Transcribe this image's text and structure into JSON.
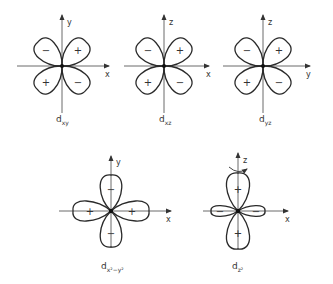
{
  "orbitals": [
    {
      "id": "dxy",
      "label_main": "d",
      "label_sub": "xy",
      "horizontal_axis": "x",
      "vertical_axis": "y",
      "lobe_orientation": "diagonal",
      "lobe_signs": {
        "upper_left": "−",
        "upper_right": "+",
        "lower_left": "+",
        "lower_right": "−"
      }
    },
    {
      "id": "dxz",
      "label_main": "d",
      "label_sub": "xz",
      "horizontal_axis": "x",
      "vertical_axis": "z",
      "lobe_orientation": "diagonal",
      "lobe_signs": {
        "upper_left": "−",
        "upper_right": "+",
        "lower_left": "+",
        "lower_right": "−"
      }
    },
    {
      "id": "dyz",
      "label_main": "d",
      "label_sub": "yz",
      "horizontal_axis": "y",
      "vertical_axis": "z",
      "lobe_orientation": "diagonal",
      "lobe_signs": {
        "upper_left": "−",
        "upper_right": "+",
        "lower_left": "+",
        "lower_right": "−"
      }
    },
    {
      "id": "dx2y2",
      "label_main": "d",
      "label_sub": "x²−y²",
      "horizontal_axis": "x",
      "vertical_axis": "y",
      "lobe_orientation": "on-axis",
      "lobe_signs": {
        "top": "−",
        "right": "+",
        "bottom": "−",
        "left": "+"
      }
    },
    {
      "id": "dz2",
      "label_main": "d",
      "label_sub": "z²",
      "horizontal_axis": "x",
      "vertical_axis": "z",
      "lobe_orientation": "on-axis",
      "rotation_symmetry_arrow": true,
      "lobe_signs": {
        "top": "+",
        "right": "−",
        "bottom": "+",
        "left": "−"
      }
    }
  ]
}
